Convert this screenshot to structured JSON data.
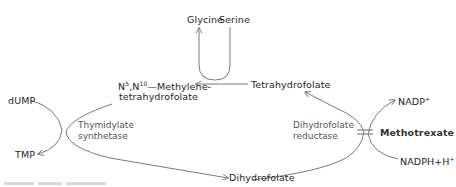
{
  "diagram": {
    "type": "metabolic-pathway",
    "nodes": {
      "glycine": "Glycine",
      "serine": "Serine",
      "methylene_thf_line1_prefix": "N",
      "methylene_thf_sup1": "5",
      "methylene_thf_mid": ",N",
      "methylene_thf_sup2": "10",
      "methylene_thf_line1_suffix": "—Methylene-",
      "methylene_thf_line2": "tetrahydrofolate",
      "tetrahydrofolate": "Tetrahydrofolate",
      "dihydrofolate": "Dihydrofolate",
      "dump": "dUMP",
      "tmp": "TMP",
      "nadp_base": "NADP",
      "nadp_sup": "+",
      "nadph_base": "NADPH+H",
      "nadph_sup": "+",
      "methotrexate": "Methotrexate"
    },
    "enzymes": {
      "thymidylate_synthetase_line1": "Thymidylate",
      "thymidylate_synthetase_line2": "synthetase",
      "dihydrofolate_reductase_line1": "Dihydrofolate",
      "dihydrofolate_reductase_line2": "reductase"
    },
    "edges": [
      {
        "from": "Tetrahydrofolate",
        "to": "N5,N10-Methylene-tetrahydrofolate",
        "via": "Serine → Glycine"
      },
      {
        "from": "N5,N10-Methylene-tetrahydrofolate",
        "to": "Dihydrofolate",
        "enzyme": "Thymidylate synthetase",
        "coupled": "dUMP → TMP"
      },
      {
        "from": "Dihydrofolate",
        "to": "Tetrahydrofolate",
        "enzyme": "Dihydrofolate reductase",
        "coupled": "NADPH+H+ → NADP+"
      },
      {
        "inhibitor": "Methotrexate",
        "target": "Dihydrofolate reductase"
      }
    ],
    "colors": {
      "line": "#6a6a6a",
      "text": "#1e1e1e",
      "enzyme_text": "#555555"
    }
  }
}
